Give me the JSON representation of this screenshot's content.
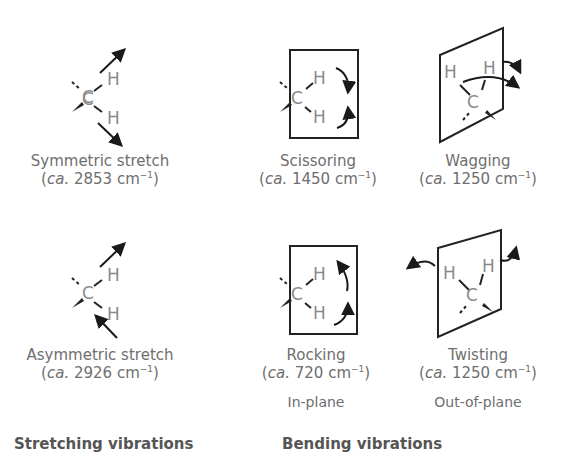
{
  "atoms": {
    "carbon": "C",
    "hydrogen": "H"
  },
  "modes": [
    {
      "id": "symmetric-stretch",
      "name": "Symmetric stretch",
      "approx": "ca.",
      "value": "2853",
      "unit": "cm",
      "exp": "−1"
    },
    {
      "id": "scissoring",
      "name": "Scissoring",
      "approx": "ca.",
      "value": "1450",
      "unit": "cm",
      "exp": "−1"
    },
    {
      "id": "wagging",
      "name": "Wagging",
      "approx": "ca.",
      "value": "1250",
      "unit": "cm",
      "exp": "−1"
    },
    {
      "id": "asymmetric-stretch",
      "name": "Asymmetric stretch",
      "approx": "ca.",
      "value": "2926",
      "unit": "cm",
      "exp": "−1"
    },
    {
      "id": "rocking",
      "name": "Rocking",
      "approx": "ca.",
      "value": "720",
      "unit": "cm",
      "exp": "−1"
    },
    {
      "id": "twisting",
      "name": "Twisting",
      "approx": "ca.",
      "value": "1250",
      "unit": "cm",
      "exp": "−1"
    }
  ],
  "sublabels": {
    "in_plane": "In-plane",
    "out_of_plane": "Out-of-plane"
  },
  "groups": {
    "stretching": "Stretching vibrations",
    "bending": "Bending vibrations"
  },
  "colors": {
    "lines": "#1a1a1a",
    "atom_text": "#8a8a8a",
    "caption_text": "#6e6e6e"
  }
}
